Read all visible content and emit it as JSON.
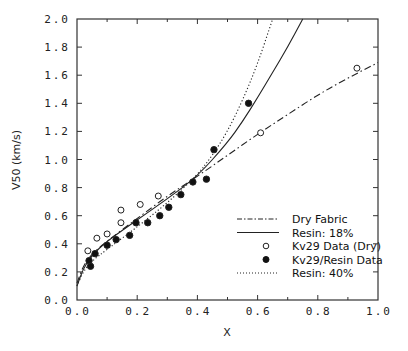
{
  "chart_data": {
    "type": "scatter",
    "title": "",
    "xlabel": "X",
    "ylabel": "V50 (km/s)",
    "xlim": [
      0.0,
      1.0
    ],
    "ylim": [
      0.0,
      2.0
    ],
    "grid": false,
    "legend_position": "lower right",
    "x_ticks": [
      "0.0",
      "0.2",
      "0.4",
      "0.6",
      "0.8",
      "1.0"
    ],
    "y_ticks": [
      "0.0",
      "0.2",
      "0.4",
      "0.6",
      "0.8",
      "1.0",
      "1.2",
      "1.4",
      "1.6",
      "1.8",
      "2.0"
    ],
    "series": [
      {
        "name": "Dry Fabric",
        "style": "dash-dot line",
        "points": [
          [
            0.0,
            0.12
          ],
          [
            0.02,
            0.24
          ],
          [
            0.05,
            0.33
          ],
          [
            0.1,
            0.42
          ],
          [
            0.2,
            0.58
          ],
          [
            0.3,
            0.74
          ],
          [
            0.4,
            0.88
          ],
          [
            0.5,
            1.03
          ],
          [
            0.6,
            1.18
          ],
          [
            0.7,
            1.32
          ],
          [
            0.8,
            1.46
          ],
          [
            0.9,
            1.58
          ],
          [
            1.0,
            1.69
          ]
        ]
      },
      {
        "name": "Resin: 18%",
        "style": "solid line",
        "points": [
          [
            0.0,
            0.1
          ],
          [
            0.02,
            0.22
          ],
          [
            0.05,
            0.32
          ],
          [
            0.1,
            0.42
          ],
          [
            0.2,
            0.57
          ],
          [
            0.3,
            0.72
          ],
          [
            0.4,
            0.88
          ],
          [
            0.5,
            1.12
          ],
          [
            0.55,
            1.27
          ],
          [
            0.6,
            1.44
          ],
          [
            0.65,
            1.62
          ],
          [
            0.7,
            1.8
          ],
          [
            0.75,
            2.0
          ]
        ]
      },
      {
        "name": "Kv29 Data (Dry)",
        "style": "open circle",
        "points": [
          [
            0.036,
            0.35
          ],
          [
            0.066,
            0.44
          ],
          [
            0.1,
            0.47
          ],
          [
            0.146,
            0.55
          ],
          [
            0.146,
            0.64
          ],
          [
            0.21,
            0.68
          ],
          [
            0.27,
            0.74
          ],
          [
            0.61,
            1.19
          ],
          [
            0.93,
            1.65
          ]
        ]
      },
      {
        "name": "Kv29/Resin Data",
        "style": "filled circle",
        "points": [
          [
            0.04,
            0.28
          ],
          [
            0.045,
            0.24
          ],
          [
            0.06,
            0.33
          ],
          [
            0.1,
            0.39
          ],
          [
            0.13,
            0.43
          ],
          [
            0.175,
            0.46
          ],
          [
            0.196,
            0.55
          ],
          [
            0.235,
            0.55
          ],
          [
            0.275,
            0.6
          ],
          [
            0.305,
            0.66
          ],
          [
            0.345,
            0.75
          ],
          [
            0.385,
            0.84
          ],
          [
            0.43,
            0.86
          ],
          [
            0.455,
            1.07
          ],
          [
            0.57,
            1.4
          ]
        ]
      },
      {
        "name": "Resin: 40%",
        "style": "dotted line",
        "points": [
          [
            0.0,
            0.1
          ],
          [
            0.02,
            0.2
          ],
          [
            0.05,
            0.28
          ],
          [
            0.1,
            0.36
          ],
          [
            0.2,
            0.52
          ],
          [
            0.3,
            0.69
          ],
          [
            0.4,
            0.89
          ],
          [
            0.45,
            1.03
          ],
          [
            0.5,
            1.2
          ],
          [
            0.55,
            1.42
          ],
          [
            0.6,
            1.68
          ],
          [
            0.65,
            2.0
          ]
        ]
      }
    ]
  },
  "legend": {
    "items": [
      {
        "label": "Dry Fabric",
        "marker": "dashdot"
      },
      {
        "label": "Resin: 18%",
        "marker": "solid"
      },
      {
        "label": "Kv29 Data (Dry)",
        "marker": "open-circle"
      },
      {
        "label": "Kv29/Resin Data",
        "marker": "filled-circle"
      },
      {
        "label": "Resin: 40%",
        "marker": "dotted"
      }
    ]
  },
  "colors": {
    "axis": "#333333",
    "line": "#222222",
    "background": "#ffffff"
  }
}
